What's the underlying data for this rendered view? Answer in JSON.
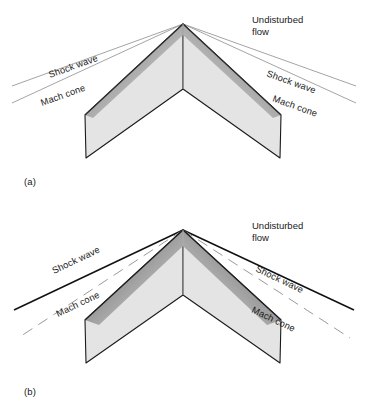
{
  "figure": {
    "title_note": "Shock wave and Mach cone over a delta wing at two Mach numbers",
    "background_color": "#ffffff",
    "ink_color": "#1a1a1a",
    "wing_fill_color": "#e3e3e3",
    "wing_shadow_color": "#8f8f8f",
    "shock_line_color_a": "#9a9a9a",
    "shock_line_color_b": "#1a1a1a",
    "mach_line_color": "#9a9a9a"
  },
  "panels": [
    {
      "id": "a",
      "panel_label": "(a)",
      "flow_label": "Undisturbed\nflow",
      "labels": {
        "shock_left": "Shock wave",
        "mach_left": "Mach cone",
        "shock_right": "Shock wave",
        "mach_right": "Mach cone"
      },
      "shock_style": "solid-thin-gray",
      "mach_style": "solid-thin-gray",
      "wing": {
        "apex": [
          183,
          24
        ],
        "left_tip_front": [
          85,
          115
        ],
        "left_tip_back": [
          86,
          158
        ],
        "notch": [
          183,
          89
        ],
        "right_tip_front": [
          281,
          115
        ],
        "right_tip_back": [
          280,
          158
        ]
      }
    },
    {
      "id": "b",
      "panel_label": "(b)",
      "flow_label": "Undisturbed\nflow",
      "labels": {
        "shock_left": "Shock wave",
        "mach_left": "Mach cone",
        "shock_right": "Shock wave",
        "mach_right": "Mach cone"
      },
      "shock_style": "solid-black",
      "mach_style": "dashed-gray",
      "wing": {
        "apex": [
          183,
          230
        ],
        "left_tip_front": [
          85,
          320
        ],
        "left_tip_back": [
          86,
          363
        ],
        "notch": [
          183,
          295
        ],
        "right_tip_front": [
          281,
          320
        ],
        "right_tip_back": [
          280,
          363
        ]
      }
    }
  ]
}
